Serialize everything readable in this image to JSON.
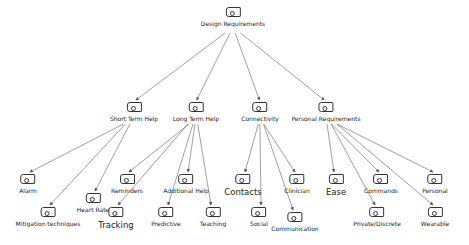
{
  "root": {
    "id": "design-requirements",
    "label": "Design Requirements",
    "x": 233,
    "y": 7
  },
  "categories": [
    {
      "id": "short-term-help",
      "label": "Short Term Help",
      "x": 134,
      "y": 102,
      "children": [
        {
          "id": "alarm",
          "label": "Alarm",
          "x": 28,
          "y": 174,
          "big": false
        },
        {
          "id": "mitigation-techniques",
          "label": "Mitigation techniques",
          "x": 48,
          "y": 207,
          "big": false
        },
        {
          "id": "heart-rate",
          "label": "Heart Rate",
          "x": 93,
          "y": 193,
          "big": false
        }
      ]
    },
    {
      "id": "long-term-help",
      "label": "Long Term Help",
      "x": 196,
      "y": 102,
      "children": [
        {
          "id": "reminders",
          "label": "Reminders",
          "x": 127,
          "y": 174,
          "big": false
        },
        {
          "id": "tracking",
          "label": "Tracking",
          "x": 116,
          "y": 207,
          "big": true
        },
        {
          "id": "additional-help",
          "label": "Additional Help",
          "x": 186,
          "y": 174,
          "big": false
        },
        {
          "id": "predictive",
          "label": "Predictive",
          "x": 166,
          "y": 207,
          "big": false
        },
        {
          "id": "teaching",
          "label": "Teaching",
          "x": 213,
          "y": 207,
          "big": false
        }
      ]
    },
    {
      "id": "connectivity",
      "label": "Connectivity",
      "x": 260,
      "y": 102,
      "children": [
        {
          "id": "contacts",
          "label": "Contacts",
          "x": 243,
          "y": 174,
          "big": true
        },
        {
          "id": "social",
          "label": "Social",
          "x": 259,
          "y": 207,
          "big": false
        },
        {
          "id": "clinician",
          "label": "Clinician",
          "x": 297,
          "y": 174,
          "big": false
        },
        {
          "id": "communication",
          "label": "Communication",
          "x": 295,
          "y": 212,
          "big": false
        }
      ]
    },
    {
      "id": "personal-requirements",
      "label": "Personal Requirements",
      "x": 326,
      "y": 102,
      "children": [
        {
          "id": "ease",
          "label": "Ease",
          "x": 336,
          "y": 174,
          "big": true
        },
        {
          "id": "commands",
          "label": "Commands",
          "x": 381,
          "y": 174,
          "big": false
        },
        {
          "id": "private-discrete",
          "label": "Private/Discrete",
          "x": 377,
          "y": 207,
          "big": false
        },
        {
          "id": "personal",
          "label": "Personal",
          "x": 435,
          "y": 174,
          "big": false
        },
        {
          "id": "wearable",
          "label": "Wearable",
          "x": 435,
          "y": 207,
          "big": false
        }
      ]
    }
  ],
  "colors": {
    "line": "#666666",
    "node_border": "#333333",
    "text": "#222222",
    "background": "#ffffff"
  }
}
